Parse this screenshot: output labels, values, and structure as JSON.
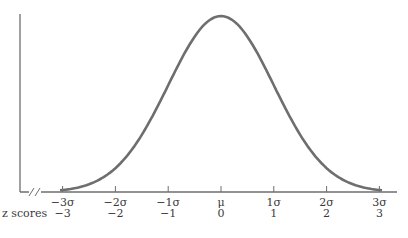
{
  "chart_data": {
    "type": "line",
    "title": "",
    "xlabel": "",
    "ylabel": "",
    "x_axis_break": true,
    "grid": false,
    "xlim": [
      -3.4,
      3.4
    ],
    "sigma_tick_labels": [
      "−3σ",
      "−2σ",
      "−1σ",
      "μ",
      "1σ",
      "2σ",
      "3σ"
    ],
    "z_score_row_label": "z scores",
    "z_score_labels": [
      "−3",
      "−2",
      "−1",
      "0",
      "1",
      "2",
      "3"
    ],
    "x": [
      -3,
      -2.5,
      -2,
      -1.5,
      -1,
      -0.5,
      0,
      0.5,
      1,
      1.5,
      2,
      2.5,
      3
    ],
    "values": [
      0.0044,
      0.0175,
      0.054,
      0.1295,
      0.242,
      0.3521,
      0.3989,
      0.3521,
      0.242,
      0.1295,
      0.054,
      0.0175,
      0.0044
    ],
    "curve_color": "#6e6e6e",
    "axis_color": "#6e6e6e"
  }
}
